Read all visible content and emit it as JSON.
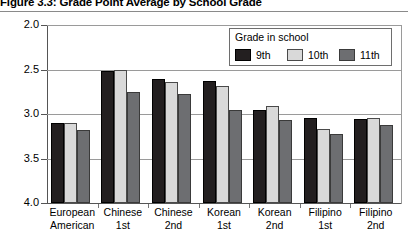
{
  "figure": {
    "title": "Figure 3.3: Grade Point Average by School Grade"
  },
  "legend": {
    "title": "Grade in school",
    "position": "top-right-inside",
    "entries": [
      {
        "label": "9th",
        "color": "#231f20"
      },
      {
        "label": "10th",
        "color": "#d9d9d9"
      },
      {
        "label": "11th",
        "color": "#6d6e71"
      }
    ]
  },
  "axes": {
    "y_ticks": [
      "4.0",
      "3.5",
      "3.0",
      "2.5",
      "2.0"
    ],
    "x_categories": [
      {
        "line1": "European",
        "line2": "American"
      },
      {
        "line1": "Chinese",
        "line2": "1st"
      },
      {
        "line1": "Chinese",
        "line2": "2nd"
      },
      {
        "line1": "Korean",
        "line2": "1st"
      },
      {
        "line1": "Korean",
        "line2": "2nd"
      },
      {
        "line1": "Filipino",
        "line2": "1st"
      },
      {
        "line1": "Filipino",
        "line2": "2nd"
      }
    ]
  },
  "chart_data": {
    "type": "bar",
    "title": "Figure 3.3: Grade Point Average by School Grade",
    "xlabel": "",
    "ylabel": "",
    "ylim": [
      2.0,
      4.0
    ],
    "ytick_values": [
      2.0,
      2.5,
      3.0,
      3.5,
      4.0
    ],
    "grid": true,
    "legend_title": "Grade in school",
    "legend_position": "top right (inside plot)",
    "categories": [
      "European American",
      "Chinese 1st",
      "Chinese 2nd",
      "Korean 1st",
      "Korean 2nd",
      "Filipino 1st",
      "Filipino 2nd"
    ],
    "series": [
      {
        "name": "9th",
        "color": "#231f20",
        "values": [
          2.9,
          3.48,
          3.39,
          3.37,
          3.05,
          2.95,
          2.94
        ]
      },
      {
        "name": "10th",
        "color": "#d9d9d9",
        "values": [
          2.9,
          3.49,
          3.36,
          3.32,
          3.09,
          2.83,
          2.95
        ]
      },
      {
        "name": "11th",
        "color": "#6d6e71",
        "values": [
          2.82,
          3.25,
          3.22,
          3.04,
          2.93,
          2.77,
          2.88
        ]
      }
    ]
  }
}
